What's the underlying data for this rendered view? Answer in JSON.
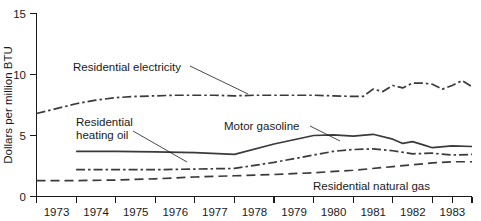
{
  "chart_data": {
    "type": "line",
    "title": "",
    "xlabel": "",
    "ylabel": "Dollars per million BTU",
    "xlim": [
      1973,
      1984
    ],
    "ylim": [
      0,
      15
    ],
    "yticks": [
      0,
      5,
      10,
      15
    ],
    "ytick_labels": [
      "0",
      "5",
      "10",
      "15"
    ],
    "xticks": [
      1973,
      1974,
      1975,
      1976,
      1977,
      1978,
      1979,
      1980,
      1981,
      1982,
      1983
    ],
    "xtick_labels": [
      "1973",
      "1974",
      "1975",
      "1976",
      "1977",
      "1978",
      "1979",
      "1980",
      "1981",
      "1982",
      "1983"
    ],
    "grid": false,
    "legend_position": "inline-annotations",
    "series": [
      {
        "name": "Residential electricity",
        "label": "Residential electricity",
        "linestyle": "dash-dot",
        "color": "#3a3a3a",
        "x": [
          1973.0,
          1973.5,
          1974.0,
          1974.5,
          1975.0,
          1975.5,
          1976.0,
          1976.5,
          1977.0,
          1977.5,
          1978.0,
          1978.5,
          1979.0,
          1979.5,
          1980.0,
          1980.5,
          1981.0,
          1981.25,
          1981.5,
          1981.75,
          1982.0,
          1982.25,
          1982.5,
          1982.75,
          1983.0,
          1983.25,
          1983.5,
          1983.75,
          1984.0
        ],
        "y": [
          6.8,
          7.2,
          7.6,
          7.9,
          8.1,
          8.2,
          8.25,
          8.3,
          8.3,
          8.3,
          8.25,
          8.3,
          8.3,
          8.3,
          8.3,
          8.25,
          8.2,
          8.2,
          8.8,
          8.6,
          9.1,
          8.9,
          9.3,
          9.3,
          9.2,
          8.8,
          9.1,
          9.5,
          9.0
        ]
      },
      {
        "name": "Motor gasoline",
        "label": "Motor gasoline",
        "linestyle": "solid",
        "color": "#3a3a3a",
        "x": [
          1974.0,
          1975.0,
          1976.0,
          1977.0,
          1978.0,
          1979.0,
          1980.0,
          1980.5,
          1981.0,
          1981.5,
          1982.0,
          1982.25,
          1982.5,
          1982.75,
          1983.0,
          1983.5,
          1984.0
        ],
        "y": [
          3.7,
          3.7,
          3.65,
          3.6,
          3.45,
          4.3,
          5.0,
          5.05,
          4.95,
          5.1,
          4.7,
          4.35,
          4.5,
          4.25,
          4.0,
          4.15,
          4.1
        ]
      },
      {
        "name": "Residential heating oil",
        "label": "Residential heating oil",
        "linestyle": "dash-dot",
        "color": "#3a3a3a",
        "x": [
          1974.0,
          1975.0,
          1976.0,
          1977.0,
          1978.0,
          1979.0,
          1980.0,
          1980.5,
          1981.0,
          1981.5,
          1982.0,
          1982.5,
          1983.0,
          1983.5,
          1984.0
        ],
        "y": [
          2.2,
          2.2,
          2.2,
          2.25,
          2.3,
          2.8,
          3.4,
          3.7,
          3.85,
          3.9,
          3.75,
          3.5,
          3.55,
          3.4,
          3.45
        ]
      },
      {
        "name": "Residential natural gas",
        "label": "Residential natural gas",
        "linestyle": "long-dash",
        "color": "#3a3a3a",
        "x": [
          1973.0,
          1974.0,
          1975.0,
          1976.0,
          1977.0,
          1978.0,
          1979.0,
          1980.0,
          1981.0,
          1982.0,
          1982.5,
          1983.0,
          1983.5,
          1984.0
        ],
        "y": [
          1.3,
          1.3,
          1.35,
          1.45,
          1.6,
          1.7,
          1.8,
          1.95,
          2.15,
          2.45,
          2.6,
          2.75,
          2.85,
          2.85
        ]
      }
    ],
    "annotations": [
      {
        "text": "Residential electricity",
        "for_series": "Residential electricity"
      },
      {
        "text": "Residential heating oil",
        "for_series": "Residential heating oil",
        "lines": [
          "Residential",
          "heating oil"
        ]
      },
      {
        "text": "Motor gasoline",
        "for_series": "Motor gasoline"
      },
      {
        "text": "Residential natural gas",
        "for_series": "Residential natural gas"
      }
    ]
  }
}
